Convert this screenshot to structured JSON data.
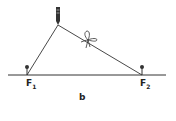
{
  "diagram": {
    "foci": [
      {
        "name": "F",
        "sub": "1"
      },
      {
        "name": "F",
        "sub": "2"
      }
    ],
    "caption": "b",
    "elements": [
      "baseline",
      "pin-F1",
      "pin-F2",
      "string",
      "pencil",
      "knot"
    ],
    "colors": {
      "ink": "#333333",
      "background": "#ffffff"
    }
  }
}
